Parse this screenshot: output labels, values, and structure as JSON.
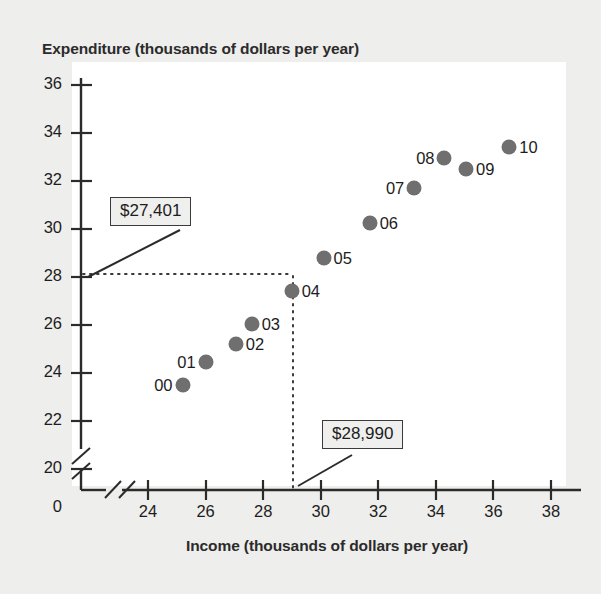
{
  "chart_data": {
    "type": "scatter",
    "title": "",
    "xlabel": "Income (thousands of dollars per year)",
    "ylabel": "Expenditure (thousands of dollars per year)",
    "xlim": [
      23.2,
      38.6
    ],
    "ylim": [
      19.2,
      36.6
    ],
    "xticks": [
      "0",
      "24",
      "26",
      "28",
      "30",
      "32",
      "34",
      "36",
      "38"
    ],
    "yticks": [
      "36",
      "34",
      "32",
      "30",
      "28",
      "26",
      "24",
      "22",
      "20",
      "0"
    ],
    "grid": false,
    "legend": null,
    "axis_break": "both",
    "marker_color": "#6f6f6f",
    "points": [
      {
        "label": "00",
        "x": 25.2,
        "y": 23.5,
        "label_side": "left"
      },
      {
        "label": "01",
        "x": 26.0,
        "y": 24.45,
        "label_side": "left"
      },
      {
        "label": "02",
        "x": 27.05,
        "y": 25.2,
        "label_side": "right"
      },
      {
        "label": "03",
        "x": 27.6,
        "y": 26.05,
        "label_side": "right"
      },
      {
        "label": "04",
        "x": 28.99,
        "y": 27.4,
        "label_side": "right"
      },
      {
        "label": "05",
        "x": 30.1,
        "y": 28.8,
        "label_side": "right"
      },
      {
        "label": "06",
        "x": 31.7,
        "y": 30.25,
        "label_side": "right"
      },
      {
        "label": "07",
        "x": 33.25,
        "y": 31.7,
        "label_side": "left"
      },
      {
        "label": "08",
        "x": 34.3,
        "y": 32.95,
        "label_side": "left"
      },
      {
        "label": "09",
        "x": 35.05,
        "y": 32.5,
        "label_side": "right"
      },
      {
        "label": "10",
        "x": 36.55,
        "y": 33.4,
        "label_side": "right"
      }
    ],
    "annotations": [
      {
        "name": "expenditure-callout",
        "text": "$27,401",
        "points_to": "y-value-of-04"
      },
      {
        "name": "income-callout",
        "text": "$28,990",
        "points_to": "x-value-of-04"
      }
    ],
    "reference_lines": [
      {
        "orientation": "horizontal",
        "value": 27.401,
        "style": "dotted"
      },
      {
        "orientation": "vertical",
        "value": 28.99,
        "style": "dotted"
      }
    ]
  }
}
